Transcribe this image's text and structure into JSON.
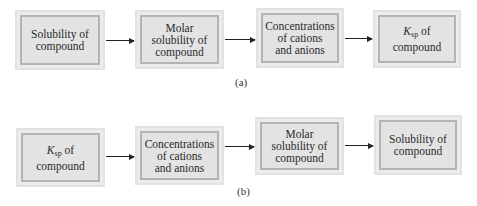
{
  "diagram": {
    "panel_a": {
      "label": "(a)",
      "boxes": [
        {
          "text": "Solubility of compound",
          "lines": [
            "Solubility of",
            "compound"
          ]
        },
        {
          "text": "Molar solubility of compound",
          "lines": [
            "Molar",
            "solubility of",
            "compound"
          ]
        },
        {
          "text": "Concentrations of cations and anions",
          "lines": [
            "Concentrations",
            "of cations",
            "and anions"
          ]
        },
        {
          "text": "Ksp of compound",
          "k": "K",
          "k_sub": "sp",
          "k_rest": " of",
          "line2": "compound"
        }
      ]
    },
    "panel_b": {
      "label": "(b)",
      "boxes": [
        {
          "text": "Ksp of compound",
          "k": "K",
          "k_sub": "sp",
          "k_rest": " of",
          "line2": "compound"
        },
        {
          "text": "Concentrations of cations and anions",
          "lines": [
            "Concentrations",
            "of cations",
            "and anions"
          ]
        },
        {
          "text": "Molar solubility of compound",
          "lines": [
            "Molar",
            "solubility of",
            "compound"
          ]
        },
        {
          "text": "Solubility of compound",
          "lines": [
            "Solubility of",
            "compound"
          ]
        }
      ]
    },
    "colors": {
      "box_outer": "#ececec",
      "box_inner_border": "#b4b4b4",
      "box_fill": "#e3e3e3",
      "arrow": "#222222"
    }
  }
}
